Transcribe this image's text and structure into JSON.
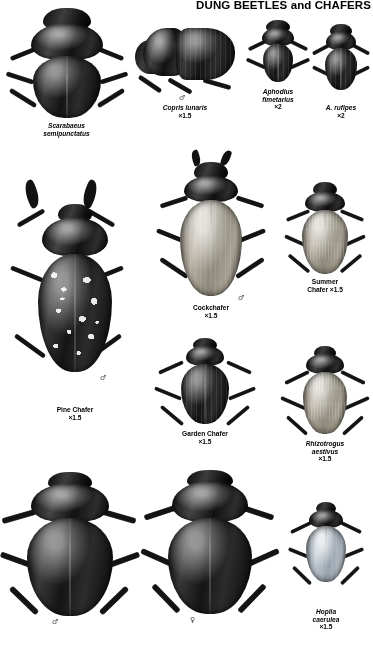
{
  "plate": {
    "title": "DUNG BEETLES and CHAFERS",
    "background_color": "#ffffff",
    "text_color": "#000000"
  },
  "symbols": {
    "male": "♂",
    "female": "♀"
  },
  "specimens": [
    {
      "id": "scarabaeus-semipunctatus",
      "name": "",
      "scientific_name_line1": "Scarabaeus",
      "scientific_name_line2": "semipunctatus",
      "magnification": "",
      "italic": true,
      "sex": ""
    },
    {
      "id": "copris-lunaris",
      "name": "",
      "scientific_name_line1": "Copris lunaris",
      "scientific_name_line2": "",
      "magnification": "×1.5",
      "italic": true,
      "sex": "♂"
    },
    {
      "id": "aphodius-fimetarius",
      "name": "",
      "scientific_name_line1": "Aphodius",
      "scientific_name_line2": "fimetarius",
      "magnification": "×2",
      "italic": true,
      "sex": ""
    },
    {
      "id": "aphodius-rufipes",
      "name": "",
      "scientific_name_line1": "A. rufipes",
      "scientific_name_line2": "",
      "magnification": "×2",
      "italic": true,
      "sex": ""
    },
    {
      "id": "cockchafer",
      "name": "Cockchafer",
      "scientific_name_line1": "",
      "scientific_name_line2": "",
      "magnification": "×1.5",
      "italic": false,
      "sex": "♂"
    },
    {
      "id": "summer-chafer",
      "name_line1": "Summer",
      "name_line2": "Chafer ×1.5",
      "magnification": "",
      "italic": false,
      "sex": ""
    },
    {
      "id": "pine-chafer",
      "name": "Pine Chafer",
      "scientific_name_line1": "",
      "scientific_name_line2": "",
      "magnification": "×1.5",
      "italic": false,
      "sex": "♂"
    },
    {
      "id": "garden-chafer",
      "name": "Garden Chafer",
      "scientific_name_line1": "",
      "scientific_name_line2": "",
      "magnification": "×1.5",
      "italic": false,
      "sex": ""
    },
    {
      "id": "rhizotrogus-aestivus",
      "name": "",
      "scientific_name_line1": "Rhizotrogus",
      "scientific_name_line2": "aestivus",
      "magnification": "×1.5",
      "italic": true,
      "sex": ""
    },
    {
      "id": "hoplia-caerulea",
      "name": "",
      "scientific_name_line1": "Hoplia",
      "scientific_name_line2": "caerulea",
      "magnification": "×1.5",
      "italic": true,
      "sex": ""
    },
    {
      "id": "bottom-left-beetle",
      "name": "",
      "scientific_name_line1": "",
      "scientific_name_line2": "",
      "magnification": "",
      "italic": false,
      "sex": "♂"
    },
    {
      "id": "bottom-middle-beetle",
      "name": "",
      "scientific_name_line1": "",
      "scientific_name_line2": "",
      "magnification": "",
      "italic": false,
      "sex": "♀"
    }
  ]
}
